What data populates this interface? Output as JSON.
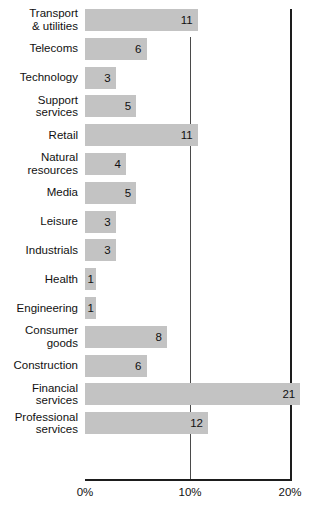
{
  "chart_data": {
    "type": "bar",
    "orientation": "horizontal",
    "title": "",
    "subtitle": "",
    "xlabel": "",
    "ylabel": "",
    "categories": [
      "Transport\n& utilities",
      "Telecoms",
      "Technology",
      "Support\nservices",
      "Retail",
      "Natural\nresources",
      "Media",
      "Leisure",
      "Industrials",
      "Health",
      "Engineering",
      "Consumer\ngoods",
      "Construction",
      "Financial\nservices",
      "Professional\nservices"
    ],
    "values": [
      11,
      6,
      3,
      5,
      11,
      4,
      5,
      3,
      3,
      1,
      1,
      8,
      6,
      21,
      12
    ],
    "value_labels": [
      "11",
      "6",
      "3",
      "5",
      "11",
      "4",
      "5",
      "3",
      "3",
      "1",
      "1",
      "8",
      "6",
      "21",
      "12"
    ],
    "xlim": [
      0,
      21.5
    ],
    "xticks": [
      0,
      10,
      20
    ],
    "xtick_labels": [
      "0%",
      "10%",
      "20%"
    ],
    "grid": "vertical-at-xticks",
    "legend": "none",
    "bar_color": "#c3c3c3",
    "axis_color": "#1d1d1d",
    "text_color": "#111111",
    "units": "percent"
  }
}
